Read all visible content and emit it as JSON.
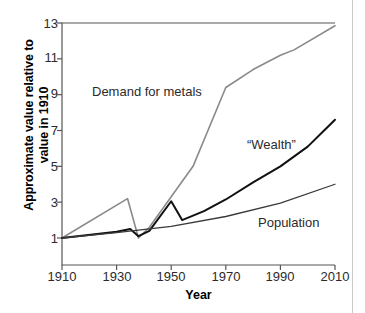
{
  "chart_data": {
    "type": "line",
    "title": "",
    "xlabel": "Year",
    "ylabel": "Approximate value relative to value in 1910",
    "ylabel_line1": "Approximate value relative to",
    "ylabel_line2": "value in 1910",
    "xlim": [
      1910,
      2010
    ],
    "ylim": [
      0,
      13
    ],
    "xticks": [
      1910,
      1930,
      1950,
      1970,
      1990,
      2010
    ],
    "yticks": [
      1,
      3,
      5,
      7,
      9,
      11,
      13
    ],
    "grid": false,
    "legend_position": "inline-annotations",
    "series": [
      {
        "name": "Demand for metals",
        "color": "#8a8a8a",
        "label_text": "Demand for metals",
        "x": [
          1910,
          1934,
          1938,
          1942,
          1950,
          1958,
          1970,
          1980,
          1990,
          1995,
          2010
        ],
        "values": [
          1.0,
          3.2,
          1.0,
          1.6,
          3.3,
          5.0,
          9.4,
          10.4,
          11.2,
          11.5,
          12.85
        ]
      },
      {
        "name": "“Wealth”",
        "color": "#111111",
        "label_text": "“Wealth”",
        "x": [
          1910,
          1930,
          1935,
          1938,
          1942,
          1950,
          1954,
          1962,
          1970,
          1980,
          1990,
          2000,
          2006,
          2010
        ],
        "values": [
          1.0,
          1.35,
          1.5,
          1.1,
          1.4,
          3.05,
          2.0,
          2.5,
          3.15,
          4.1,
          5.0,
          6.1,
          7.0,
          7.6
        ]
      },
      {
        "name": "Population",
        "color": "#3a3a3a",
        "label_text": "Population",
        "x": [
          1910,
          1930,
          1950,
          1970,
          1990,
          2010
        ],
        "values": [
          1.0,
          1.3,
          1.65,
          2.2,
          2.95,
          4.0
        ]
      }
    ]
  },
  "axes": {
    "ylabel_line1": "Approximate value relative to",
    "ylabel_line2": "value in 1910",
    "xlabel": "Year"
  }
}
